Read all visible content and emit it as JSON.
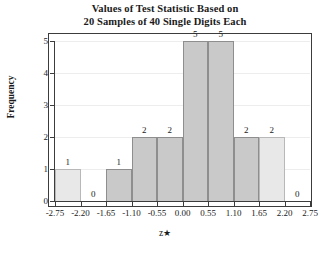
{
  "chart_data": {
    "type": "bar",
    "title": "Values of Test Statistic Based on 20 Samples of 40 Single Digits Each",
    "title_lines": [
      "Values of Test Statistic Based on",
      "20 Samples of 40 Single Digits Each"
    ],
    "xlabel": "z★",
    "xlabel_text": "z",
    "xlabel_symbol": "★",
    "ylabel": "Frequency",
    "categories": [
      "-2.75 to -2.20",
      "-2.20 to -1.65",
      "-1.65 to -1.10",
      "-1.10 to -0.55",
      "-0.55 to 0.00",
      "0.00 to 0.55",
      "0.55 to 1.10",
      "1.10 to 1.65",
      "1.65 to 2.20",
      "2.20 to 2.75"
    ],
    "values": [
      1,
      0,
      1,
      2,
      2,
      5,
      5,
      2,
      2,
      0
    ],
    "bar_labels": [
      "1",
      "0",
      "1",
      "2",
      "2",
      "5",
      "5",
      "2",
      "2",
      "0"
    ],
    "bar_styles": [
      "tail",
      "empty",
      "mid",
      "mid",
      "mid",
      "mid",
      "mid",
      "mid",
      "tail",
      "empty"
    ],
    "bin_edges": [
      -2.75,
      -2.2,
      -1.65,
      -1.1,
      -0.55,
      0.0,
      0.55,
      1.1,
      1.65,
      2.2,
      2.75
    ],
    "x_tick_labels": [
      "-2.75",
      "-2.20",
      "-1.65",
      "-1.10",
      "-0.55",
      "0.00",
      "0.55",
      "1.10",
      "1.65",
      "2.20",
      "2.75"
    ],
    "y_tick_labels": [
      "0",
      "1",
      "2",
      "3",
      "4",
      "5"
    ],
    "y_ticks": [
      0,
      1,
      2,
      3,
      4,
      5
    ],
    "ylim": [
      0,
      5
    ],
    "xlim": [
      -2.75,
      2.75
    ],
    "grid": true,
    "grid_axis": "y",
    "legend": null,
    "colors": {
      "bar_mid_fill": "#c9c9c9",
      "bar_mid_border": "#8e8e8e",
      "bar_tail_fill": "#e8e8e8",
      "bar_tail_border": "#b8b8b8",
      "gridline": "#ededed",
      "axis": "#3c3c3c",
      "text": "#1a1a1a",
      "background": "#ffffff"
    }
  }
}
